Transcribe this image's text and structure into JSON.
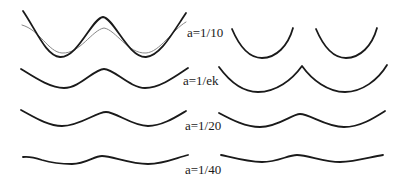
{
  "figure": {
    "rows": [
      {
        "label": "a=1/10",
        "label_pos": [
          187,
          26
        ]
      },
      {
        "label": "a=1/ek",
        "label_pos": [
          183,
          73
        ]
      },
      {
        "label": "a=1/20",
        "label_pos": [
          185,
          118
        ]
      },
      {
        "label": "a=1/40",
        "label_pos": [
          185,
          162
        ]
      }
    ]
  },
  "colors": {
    "curve": "#1a1a1a",
    "thin_curve": "#888888",
    "background": "#ffffff"
  }
}
